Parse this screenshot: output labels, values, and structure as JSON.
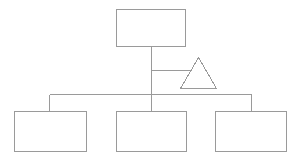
{
  "diagram": {
    "type": "hierarchy-tree",
    "title": "",
    "background_color": "#ffffff",
    "stroke_color": "#9a9a9a",
    "stroke_width": 1,
    "fill_color": "#ffffff",
    "canvas": {
      "width": 298,
      "height": 160
    },
    "nodes": [
      {
        "id": "root-box",
        "shape": "rectangle",
        "label": "",
        "x": 116,
        "y": 9,
        "width": 69,
        "height": 37
      },
      {
        "id": "side-triangle",
        "shape": "triangle",
        "label": "",
        "apex_x": 198,
        "apex_y": 57,
        "base_left_x": 181,
        "base_right_x": 216,
        "base_y": 88
      },
      {
        "id": "leaf-box-left",
        "shape": "rectangle",
        "label": "",
        "x": 14,
        "y": 111,
        "width": 72,
        "height": 40
      },
      {
        "id": "leaf-box-middle",
        "shape": "rectangle",
        "label": "",
        "x": 116,
        "y": 111,
        "width": 70,
        "height": 40
      },
      {
        "id": "leaf-box-right",
        "shape": "rectangle",
        "label": "",
        "x": 215,
        "y": 111,
        "width": 71,
        "height": 40
      }
    ],
    "connectors": [
      {
        "id": "root-trunk",
        "label": "",
        "orientation": "vertical",
        "x1": 151,
        "y1": 46,
        "x2": 151,
        "y2": 94
      },
      {
        "id": "triangle-branch",
        "label": "",
        "orientation": "horizontal",
        "x1": 151,
        "y1": 70,
        "x2": 190,
        "y2": 70
      },
      {
        "id": "distribution-bar",
        "label": "",
        "orientation": "horizontal",
        "x1": 49,
        "y1": 94,
        "x2": 251,
        "y2": 94
      },
      {
        "id": "drop-left",
        "label": "",
        "orientation": "vertical",
        "x1": 49,
        "y1": 94,
        "x2": 49,
        "y2": 111
      },
      {
        "id": "drop-middle",
        "label": "",
        "orientation": "vertical",
        "x1": 151,
        "y1": 94,
        "x2": 151,
        "y2": 111
      },
      {
        "id": "drop-right",
        "label": "",
        "orientation": "vertical",
        "x1": 251,
        "y1": 94,
        "x2": 251,
        "y2": 111
      }
    ]
  }
}
